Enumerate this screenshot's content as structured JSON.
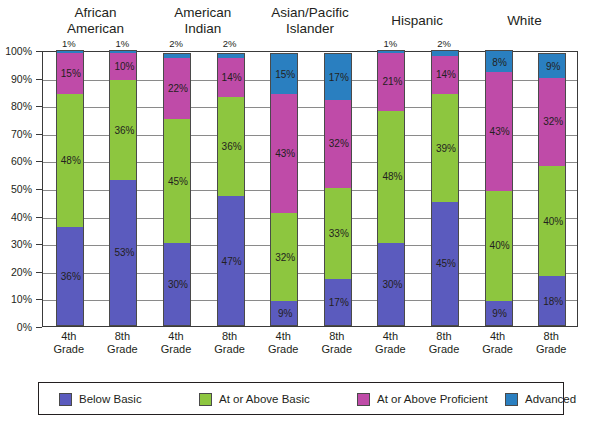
{
  "chart_data": {
    "type": "bar",
    "subtype": "stacked-bar-100",
    "title": "",
    "xlabel": "",
    "ylabel": "",
    "ylim": [
      0,
      100
    ],
    "ytick_labels": [
      "0%",
      "10%",
      "20%",
      "30%",
      "40%",
      "50%",
      "60%",
      "70%",
      "80%",
      "90%",
      "100%"
    ],
    "ytick_values": [
      0,
      10,
      20,
      30,
      40,
      50,
      60,
      70,
      80,
      90,
      100
    ],
    "grid": true,
    "legend_position": "bottom",
    "group_labels": [
      "African American",
      "American Indian",
      "Asian/Pacific Islander",
      "Hispanic",
      "White"
    ],
    "categories": [
      "4th Grade",
      "8th Grade",
      "4th Grade",
      "8th Grade",
      "4th Grade",
      "8th Grade",
      "4th Grade",
      "8th Grade",
      "4th Grade",
      "8th Grade"
    ],
    "series": [
      {
        "name": "Below Basic",
        "color": "#5b5bbe",
        "values": [
          36,
          53,
          30,
          47,
          9,
          17,
          30,
          45,
          9,
          18
        ]
      },
      {
        "name": "At or Above Basic",
        "color": "#8dc63f",
        "values": [
          48,
          36,
          45,
          36,
          32,
          33,
          48,
          39,
          40,
          40
        ]
      },
      {
        "name": "At or Above Proficient",
        "color": "#bf4ba8",
        "values": [
          15,
          10,
          22,
          14,
          43,
          32,
          21,
          14,
          43,
          32
        ]
      },
      {
        "name": "Advanced",
        "color": "#2a7fc0",
        "values": [
          1,
          1,
          2,
          2,
          15,
          17,
          1,
          2,
          8,
          9
        ]
      }
    ],
    "bars": [
      {
        "group": "African American",
        "grade": "4th Grade",
        "grade_line1": "4th",
        "grade_line2": "Grade",
        "segments": [
          {
            "series": "Below Basic",
            "value": 36,
            "label": "36%",
            "label_inside": true
          },
          {
            "series": "At or Above Basic",
            "value": 48,
            "label": "48%",
            "label_inside": true
          },
          {
            "series": "At or Above Proficient",
            "value": 15,
            "label": "15%",
            "label_inside": true
          },
          {
            "series": "Advanced",
            "value": 1,
            "label": "1%",
            "label_inside": false
          }
        ]
      },
      {
        "group": "African American",
        "grade": "8th Grade",
        "grade_line1": "8th",
        "grade_line2": "Grade",
        "segments": [
          {
            "series": "Below Basic",
            "value": 53,
            "label": "53%",
            "label_inside": true
          },
          {
            "series": "At or Above Basic",
            "value": 36,
            "label": "36%",
            "label_inside": true
          },
          {
            "series": "At or Above Proficient",
            "value": 10,
            "label": "10%",
            "label_inside": true
          },
          {
            "series": "Advanced",
            "value": 1,
            "label": "1%",
            "label_inside": false
          }
        ]
      },
      {
        "group": "American Indian",
        "grade": "4th Grade",
        "grade_line1": "4th",
        "grade_line2": "Grade",
        "segments": [
          {
            "series": "Below Basic",
            "value": 30,
            "label": "30%",
            "label_inside": true
          },
          {
            "series": "At or Above Basic",
            "value": 45,
            "label": "45%",
            "label_inside": true
          },
          {
            "series": "At or Above Proficient",
            "value": 22,
            "label": "22%",
            "label_inside": true
          },
          {
            "series": "Advanced",
            "value": 2,
            "label": "2%",
            "label_inside": false
          }
        ]
      },
      {
        "group": "American Indian",
        "grade": "8th Grade",
        "grade_line1": "8th",
        "grade_line2": "Grade",
        "segments": [
          {
            "series": "Below Basic",
            "value": 47,
            "label": "47%",
            "label_inside": true
          },
          {
            "series": "At or Above Basic",
            "value": 36,
            "label": "36%",
            "label_inside": true
          },
          {
            "series": "At or Above Proficient",
            "value": 14,
            "label": "14%",
            "label_inside": true
          },
          {
            "series": "Advanced",
            "value": 2,
            "label": "2%",
            "label_inside": false
          }
        ]
      },
      {
        "group": "Asian/Pacific Islander",
        "grade": "4th Grade",
        "grade_line1": "4th",
        "grade_line2": "Grade",
        "segments": [
          {
            "series": "Below Basic",
            "value": 9,
            "label": "9%",
            "label_inside": true
          },
          {
            "series": "At or Above Basic",
            "value": 32,
            "label": "32%",
            "label_inside": true
          },
          {
            "series": "At or Above Proficient",
            "value": 43,
            "label": "43%",
            "label_inside": true
          },
          {
            "series": "Advanced",
            "value": 15,
            "label": "15%",
            "label_inside": true
          }
        ]
      },
      {
        "group": "Asian/Pacific Islander",
        "grade": "8th Grade",
        "grade_line1": "8th",
        "grade_line2": "Grade",
        "segments": [
          {
            "series": "Below Basic",
            "value": 17,
            "label": "17%",
            "label_inside": true
          },
          {
            "series": "At or Above Basic",
            "value": 33,
            "label": "33%",
            "label_inside": true
          },
          {
            "series": "At or Above Proficient",
            "value": 32,
            "label": "32%",
            "label_inside": true
          },
          {
            "series": "Advanced",
            "value": 17,
            "label": "17%",
            "label_inside": true
          }
        ]
      },
      {
        "group": "Hispanic",
        "grade": "4th Grade",
        "grade_line1": "4th",
        "grade_line2": "Grade",
        "segments": [
          {
            "series": "Below Basic",
            "value": 30,
            "label": "30%",
            "label_inside": true
          },
          {
            "series": "At or Above Basic",
            "value": 48,
            "label": "48%",
            "label_inside": true
          },
          {
            "series": "At or Above Proficient",
            "value": 21,
            "label": "21%",
            "label_inside": true
          },
          {
            "series": "Advanced",
            "value": 1,
            "label": "1%",
            "label_inside": false
          }
        ]
      },
      {
        "group": "Hispanic",
        "grade": "8th Grade",
        "grade_line1": "8th",
        "grade_line2": "Grade",
        "segments": [
          {
            "series": "Below Basic",
            "value": 45,
            "label": "45%",
            "label_inside": true
          },
          {
            "series": "At or Above Basic",
            "value": 39,
            "label": "39%",
            "label_inside": true
          },
          {
            "series": "At or Above Proficient",
            "value": 14,
            "label": "14%",
            "label_inside": true
          },
          {
            "series": "Advanced",
            "value": 2,
            "label": "2%",
            "label_inside": false
          }
        ]
      },
      {
        "group": "White",
        "grade": "4th Grade",
        "grade_line1": "4th",
        "grade_line2": "Grade",
        "segments": [
          {
            "series": "Below Basic",
            "value": 9,
            "label": "9%",
            "label_inside": true
          },
          {
            "series": "At or Above Basic",
            "value": 40,
            "label": "40%",
            "label_inside": true
          },
          {
            "series": "At or Above Proficient",
            "value": 43,
            "label": "43%",
            "label_inside": true
          },
          {
            "series": "Advanced",
            "value": 8,
            "label": "8%",
            "label_inside": true
          }
        ]
      },
      {
        "group": "White",
        "grade": "8th Grade",
        "grade_line1": "8th",
        "grade_line2": "Grade",
        "segments": [
          {
            "series": "Below Basic",
            "value": 18,
            "label": "18%",
            "label_inside": true
          },
          {
            "series": "At or Above Basic",
            "value": 40,
            "label": "40%",
            "label_inside": true
          },
          {
            "series": "At or Above Proficient",
            "value": 32,
            "label": "32%",
            "label_inside": true
          },
          {
            "series": "Advanced",
            "value": 9,
            "label": "9%",
            "label_inside": true
          }
        ]
      }
    ],
    "legend": [
      {
        "label": "Below Basic",
        "color": "#5b5bbe"
      },
      {
        "label": "At or Above Basic",
        "color": "#8dc63f"
      },
      {
        "label": "At or Above Proficient",
        "color": "#bf4ba8"
      },
      {
        "label": "Advanced",
        "color": "#2a7fc0"
      }
    ]
  },
  "colors": {
    "below_basic": "#5b5bbe",
    "at_or_above_basic": "#8dc63f",
    "at_or_above_proficient": "#bf4ba8",
    "advanced": "#2a7fc0",
    "axis": "#3a3a3a",
    "grid": "#8a8a8a",
    "text": "#231f20",
    "background": "#ffffff"
  }
}
